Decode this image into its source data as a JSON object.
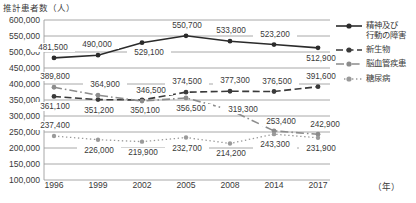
{
  "chart_data": {
    "type": "line",
    "title": "推計患者数（人）",
    "xlabel": "（年）",
    "ylabel": "推計患者数（人）",
    "ylim": [
      100000,
      600000
    ],
    "ytick_step": 50000,
    "ytick_labels": [
      "600,000",
      "550,000",
      "500,000",
      "450,000",
      "400,000",
      "350,000",
      "300,000",
      "250,000",
      "200,000",
      "150,000",
      "100,000"
    ],
    "grid": true,
    "legend_position": "right",
    "categories": [
      "1996",
      "1999",
      "2002",
      "2005",
      "2008",
      "2014",
      "2017"
    ],
    "x": [
      1996,
      1999,
      2002,
      2005,
      2008,
      2014,
      2017
    ],
    "series": [
      {
        "name": "精神及び行動の障害",
        "legend_label_line1": "精神及び",
        "legend_label_line2": "行動の障害",
        "style": "solid",
        "color": "#2b2b2b",
        "values": [
          481500,
          490000,
          529100,
          550700,
          533800,
          523200,
          512900
        ],
        "value_labels": [
          "481,500",
          "490,000",
          "529,100",
          "550,700",
          "533,800",
          "523,200",
          "512,900"
        ]
      },
      {
        "name": "新生物",
        "legend_label_line1": "新生物",
        "style": "dashed",
        "color": "#3a3a3a",
        "values": [
          361100,
          351200,
          350100,
          374500,
          377300,
          376500,
          391600
        ],
        "value_labels": [
          "361,100",
          "351,200",
          "350,100",
          "374,500",
          "377,300",
          "376,500",
          "391,600"
        ]
      },
      {
        "name": "脳血管疾患",
        "legend_label_line1": "脳血管疾患",
        "style": "dashdot",
        "color": "#8c8c8c",
        "values": [
          389800,
          364900,
          346500,
          356500,
          319300,
          253400,
          242900
        ],
        "value_labels": [
          "389,800",
          "364,900",
          "346,500",
          "356,500",
          "319,300",
          "253,400",
          "242,900"
        ]
      },
      {
        "name": "糖尿病",
        "legend_label_line1": "糖尿病",
        "style": "dotted",
        "color": "#9a9a9a",
        "values": [
          237400,
          226000,
          219900,
          232700,
          214200,
          243300,
          231900
        ],
        "value_labels": [
          "237,400",
          "226,000",
          "219,900",
          "232,700",
          "214,200",
          "243,300",
          "231,900"
        ]
      }
    ]
  }
}
